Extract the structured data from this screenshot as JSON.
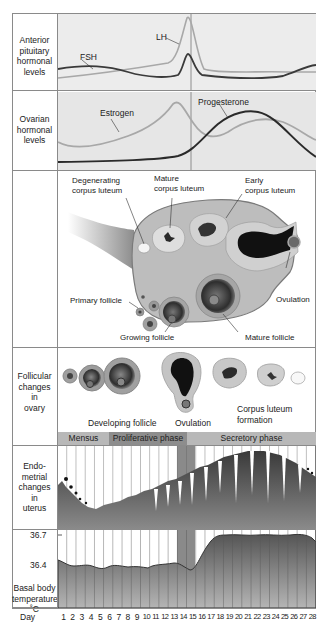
{
  "rows": {
    "pituitary": {
      "label": "Anterior pituitary hormonal levels",
      "lines": [
        "Anterior",
        "pituitary",
        "hormonal",
        "levels"
      ],
      "series": [
        {
          "name": "LH",
          "color": "#a8a8a8"
        },
        {
          "name": "FSH",
          "color": "#3a3a3a"
        }
      ]
    },
    "ovarian": {
      "label": "Ovarian hormonal levels",
      "lines": [
        "Ovarian",
        "hormonal",
        "levels"
      ],
      "series": [
        {
          "name": "Estrogen",
          "color": "#a8a8a8"
        },
        {
          "name": "Progesterone",
          "color": "#2a2a2a"
        }
      ]
    },
    "ovary": {
      "annotations": [
        "Degenerating corpus luteum",
        "Mature corpus luteum",
        "Early corpus luteum",
        "Primary follicle",
        "Growing follicle",
        "Mature follicle",
        "Ovulation"
      ],
      "text": {
        "degen1": "Degenerating",
        "degen2": "corpus luteum",
        "mature1": "Mature",
        "mature2": "corpus luteum",
        "early1": "Early",
        "early2": "corpus luteum",
        "primary": "Primary follicle",
        "growing": "Growing follicle",
        "maturef": "Mature follicle",
        "ovulation": "Ovulation"
      }
    },
    "follicular": {
      "lines": [
        "Follicular",
        "changes",
        "in",
        "ovary"
      ],
      "captions": {
        "developing": "Developing follicle",
        "ovulation": "Ovulation",
        "cl1": "Corpus luteum",
        "cl2": "formation"
      }
    },
    "phases": [
      {
        "name": "Mensus",
        "start_day": 1,
        "end_day": 5
      },
      {
        "name": "Proliferative phase",
        "start_day": 6,
        "end_day": 14
      },
      {
        "name": "Secretory phase",
        "start_day": 15,
        "end_day": 28
      }
    ],
    "endometrial": {
      "lines": [
        "Endo-",
        "metrial",
        "changes",
        "in",
        "uterus"
      ]
    },
    "bbt": {
      "lines": [
        "Basal body",
        "temperature",
        "˚C"
      ],
      "ticks": [
        "36.7",
        "36.4"
      ]
    }
  },
  "day_axis": {
    "label": "Day",
    "days": [
      "1",
      "2",
      "3",
      "4",
      "5",
      "6",
      "7",
      "8",
      "9",
      "10",
      "11",
      "12",
      "13",
      "14",
      "15",
      "16",
      "17",
      "18",
      "19",
      "20",
      "21",
      "22",
      "23",
      "24",
      "25",
      "26",
      "27",
      "28"
    ]
  },
  "chart_data": {
    "type": "line",
    "x": [
      1,
      2,
      3,
      4,
      5,
      6,
      7,
      8,
      9,
      10,
      11,
      12,
      13,
      14,
      15,
      16,
      17,
      18,
      19,
      20,
      21,
      22,
      23,
      24,
      25,
      26,
      27,
      28
    ],
    "xlabel": "Day",
    "series": [
      {
        "name": "LH (relative)",
        "values": [
          10,
          11,
          12,
          13,
          14,
          15,
          16,
          17,
          18,
          19,
          20,
          22,
          30,
          100,
          40,
          15,
          14,
          14,
          14,
          14,
          14,
          14,
          14,
          14,
          13,
          12,
          12,
          12
        ]
      },
      {
        "name": "FSH (relative)",
        "values": [
          22,
          23,
          23,
          22,
          20,
          18,
          16,
          14,
          12,
          11,
          10,
          10,
          11,
          40,
          14,
          11,
          10,
          10,
          9,
          9,
          9,
          9,
          10,
          12,
          16,
          20,
          24,
          26
        ]
      },
      {
        "name": "Estrogen (relative)",
        "values": [
          30,
          28,
          28,
          30,
          33,
          37,
          41,
          46,
          52,
          60,
          72,
          86,
          96,
          60,
          45,
          44,
          50,
          56,
          60,
          62,
          62,
          60,
          56,
          50,
          44,
          38,
          32,
          28
        ]
      },
      {
        "name": "Progesterone (relative)",
        "values": [
          5,
          5,
          5,
          5,
          5,
          5,
          6,
          6,
          6,
          7,
          8,
          10,
          14,
          22,
          38,
          58,
          76,
          88,
          96,
          98,
          94,
          86,
          74,
          60,
          44,
          30,
          20,
          14
        ]
      },
      {
        "name": "Basal body temperature (°C)",
        "values": [
          36.45,
          36.4,
          36.4,
          36.42,
          36.38,
          36.41,
          36.4,
          36.4,
          36.41,
          36.39,
          36.42,
          36.43,
          36.44,
          36.42,
          36.35,
          36.5,
          36.66,
          36.7,
          36.7,
          36.7,
          36.69,
          36.7,
          36.68,
          36.71,
          36.69,
          36.7,
          36.7,
          36.63
        ]
      }
    ],
    "yticks_bbt": [
      36.4,
      36.7
    ],
    "annotations": [
      "LH",
      "FSH",
      "Estrogen",
      "Progesterone"
    ],
    "phases": [
      "Mensus",
      "Proliferative phase",
      "Secretory phase"
    ],
    "ovulation_day": 14
  }
}
